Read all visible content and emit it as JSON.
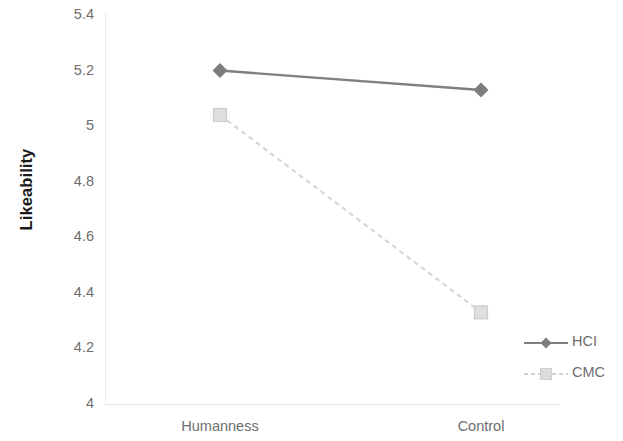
{
  "chart_data": {
    "type": "line",
    "title": "",
    "subtitle": "",
    "xlabel": "",
    "ylabel": "Likeability",
    "categories": [
      "Humanness",
      "Control"
    ],
    "series": [
      {
        "name": "HCI",
        "values": [
          5.2,
          5.13
        ],
        "color": "#808080",
        "line_style": "solid",
        "marker": "diamond"
      },
      {
        "name": "CMC",
        "values": [
          5.04,
          4.33
        ],
        "color": "#d4d4d4",
        "line_style": "dashed",
        "marker": "square"
      }
    ],
    "ylim": [
      4,
      5.4
    ],
    "ytick_labels": [
      "5.4",
      "5.2",
      "5",
      "4.8",
      "4.6",
      "4.4",
      "4.2",
      "4"
    ],
    "ytick_values": [
      5.4,
      5.2,
      5.0,
      4.8,
      4.6,
      4.4,
      4.2,
      4.0
    ],
    "grid": false,
    "legend_position": "right"
  },
  "axes": {
    "y_title": "Likeability",
    "y_ticks": [
      "5.4",
      "5.2",
      "5",
      "4.8",
      "4.6",
      "4.4",
      "4.2",
      "4"
    ],
    "x_ticks": [
      "Humanness",
      "Control"
    ]
  },
  "legend": {
    "entries": [
      {
        "label": "HCI"
      },
      {
        "label": "CMC"
      }
    ]
  }
}
